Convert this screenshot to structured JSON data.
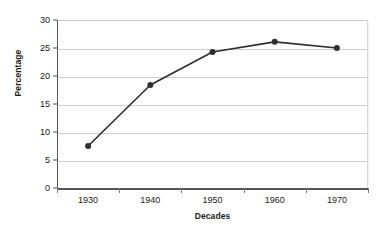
{
  "chart_data": {
    "type": "line",
    "title": "",
    "xlabel": "Decades",
    "ylabel": "Percentage",
    "categories": [
      "1930",
      "1940",
      "1950",
      "1960",
      "1970"
    ],
    "x": [
      1930,
      1940,
      1950,
      1960,
      1970
    ],
    "values": [
      7.5,
      18.4,
      24.3,
      26.1,
      25.0
    ],
    "series": [
      {
        "name": "Percentage",
        "values": [
          7.5,
          18.4,
          24.3,
          26.1,
          25.0
        ]
      }
    ],
    "ylim": [
      0,
      30
    ],
    "yticks": [
      0,
      5,
      10,
      15,
      20,
      25,
      30
    ],
    "ytick_labels": [
      "0",
      "5",
      "10",
      "15",
      "20",
      "25",
      "30"
    ],
    "xtick_labels": [
      "1930",
      "1940",
      "1950",
      "1960",
      "1970"
    ],
    "grid": "horizontal",
    "legend": "none",
    "marker": "filled-circle",
    "line_color": "#2e2e2e",
    "marker_color": "#2e2e2e",
    "grid_color": "#cfcfcf",
    "axis_color": "#555555",
    "background_color": "#ffffff"
  }
}
